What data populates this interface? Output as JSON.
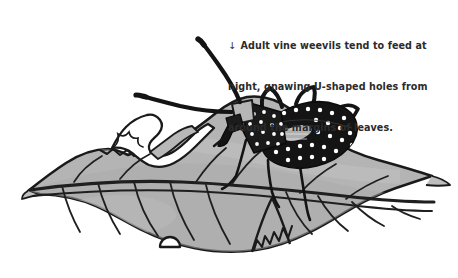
{
  "figure": {
    "background_color": "#ffffff",
    "caption": {
      "marker": "↓",
      "marker_name": "down-arrow-icon",
      "text_color": "#2b2b2b",
      "lines": [
        "Adult vine weevils tend to feed at",
        "night, gnawing U-shaped holes from",
        "around the margins of leaves."
      ],
      "full_text": "↓ Adult vine weevils tend to feed at night, gnawing U-shaped holes from around the margins of leaves."
    },
    "illustration": {
      "style": "black-and-white pen-and-ink line drawing with flat grey fill",
      "colors": {
        "leaf_fill": "#b4b4b4",
        "leaf_fill_shadow": "#a2a2a2",
        "leaf_fill_highlight": "#c4c4c4",
        "outline": "#1a1a1a",
        "vein": "#1f1f1f",
        "insect_body": "#141414",
        "insect_spots": "#ffffff",
        "insect_thorax_fill": "#1a1a1a",
        "hole_fill": "#ffffff",
        "highlight_patch": "#d8d8d8"
      },
      "elements": [
        {
          "name": "leaf",
          "description": "Large lobed leaf spanning the lower two thirds of the image, grey fill with heavy dark outline, pointed tips at left and right"
        },
        {
          "name": "leaf-midrib",
          "description": "Thick dark central vein running left to right across the leaf"
        },
        {
          "name": "leaf-side-veins",
          "description": "Curved secondary veins branching from the midrib toward the leaf margins"
        },
        {
          "name": "u-shaped-feeding-holes",
          "description": "White notches chewed out of the leaf margin, including a large ragged hole in the upper left and a small semicircular notch on the lower edge"
        },
        {
          "name": "serrated-margin",
          "description": "Finely toothed sections of the leaf edge showing gnawing damage"
        },
        {
          "name": "vine-weevil",
          "description": "Adult vine weevil perched on the leaf, dark pear-shaped body covered with white speckles"
        },
        {
          "name": "weevil-abdomen",
          "description": "Large black oval elytra with rows of white dots and a pale highlight patch"
        },
        {
          "name": "weevil-thorax",
          "description": "Smaller dark shield-shaped segment in front of the abdomen with white speckles"
        },
        {
          "name": "weevil-rostrum",
          "description": "Short downward-pointing snout at the front of the head"
        },
        {
          "name": "weevil-antennae",
          "description": "Two long elbowed antennae, one sweeping up and right, one sweeping down and left"
        },
        {
          "name": "weevil-legs",
          "description": "Six thin dark legs, two arched above the body and others reaching down to the leaf surface"
        }
      ]
    }
  }
}
